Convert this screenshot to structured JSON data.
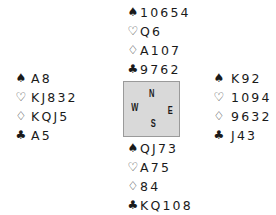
{
  "suit_symbols": {
    "spades": "♠",
    "hearts": "♡",
    "diamonds": "♢",
    "clubs": "♣"
  },
  "compass": {
    "north": "N",
    "west": "W",
    "east": "E",
    "south": "S"
  },
  "hands": {
    "north": {
      "spades": "10654",
      "hearts": "Q6",
      "diamonds": "A107",
      "clubs": "9762"
    },
    "west": {
      "spades": "A8",
      "hearts": "KJ832",
      "diamonds": "KQJ5",
      "clubs": "A5"
    },
    "east": {
      "spades": "K92",
      "hearts": "1094",
      "diamonds": "9632",
      "clubs": "J43"
    },
    "south": {
      "spades": "QJ73",
      "hearts": "A75",
      "diamonds": "84",
      "clubs": "KQ108"
    }
  },
  "colors": {
    "text": "#1a1a1a",
    "compass_bg": "#d9d9d9",
    "compass_border": "#9a9a9a"
  }
}
